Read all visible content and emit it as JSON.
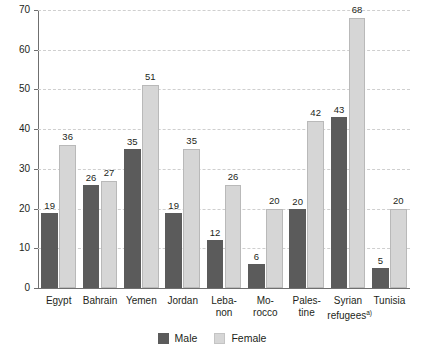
{
  "chart_data": {
    "type": "bar",
    "title": "",
    "subtitle": "",
    "xlabel": "",
    "ylabel": "",
    "ylim": [
      0,
      70
    ],
    "ytick_step": 10,
    "yticks": [
      "70",
      "60",
      "50",
      "40",
      "30",
      "20",
      "10",
      "0"
    ],
    "grid": true,
    "grid_style": "dashed-horizontal",
    "legend_position": "bottom-center",
    "categories": [
      "Egypt",
      "Bahrain",
      "Yemen",
      "Jordan",
      "Leba-\nnon",
      "Mo-\nrocco",
      "Pales-\ntine",
      "Syrian\nrefugees",
      "Tunisia"
    ],
    "category_footnotes": [
      "",
      "",
      "",
      "",
      "",
      "",
      "",
      "a)",
      ""
    ],
    "series": [
      {
        "name": "Male",
        "color": "#5b5b5b",
        "values": [
          19,
          26,
          35,
          19,
          12,
          6,
          20,
          43,
          5
        ]
      },
      {
        "name": "Female",
        "color": "#d6d6d6",
        "values": [
          36,
          27,
          51,
          35,
          26,
          20,
          42,
          68,
          20
        ]
      }
    ]
  },
  "legend": {
    "items": [
      {
        "label": "Male",
        "swatch": "male-swatch"
      },
      {
        "label": "Female",
        "swatch": "female-swatch"
      }
    ]
  }
}
